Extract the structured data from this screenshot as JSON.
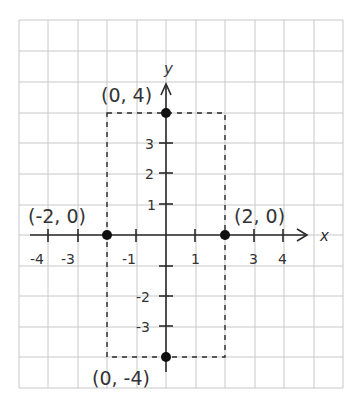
{
  "diagram": {
    "type": "coordinate-plane",
    "axes": {
      "x_label": "x",
      "y_label": "y",
      "x_tick_labels": [
        "-4",
        "-3",
        "-1",
        "1",
        "3",
        "4"
      ],
      "y_tick_labels": [
        "3",
        "2",
        "1",
        "-2",
        "-3"
      ]
    },
    "points": [
      {
        "label": "(0, 4)",
        "x": 0,
        "y": 4
      },
      {
        "label": "(-2, 0)",
        "x": -2,
        "y": 0
      },
      {
        "label": "(2, 0)",
        "x": 2,
        "y": 0
      },
      {
        "label": "(0, -4)",
        "x": 0,
        "y": -4
      }
    ],
    "dashed_rectangle": {
      "x_min": -2,
      "x_max": 2,
      "y_min": -4,
      "y_max": 4
    },
    "colors": {
      "grid": "#c8c8c8",
      "axis": "#2a2a2a",
      "point": "#111111",
      "text": "#333333"
    }
  }
}
